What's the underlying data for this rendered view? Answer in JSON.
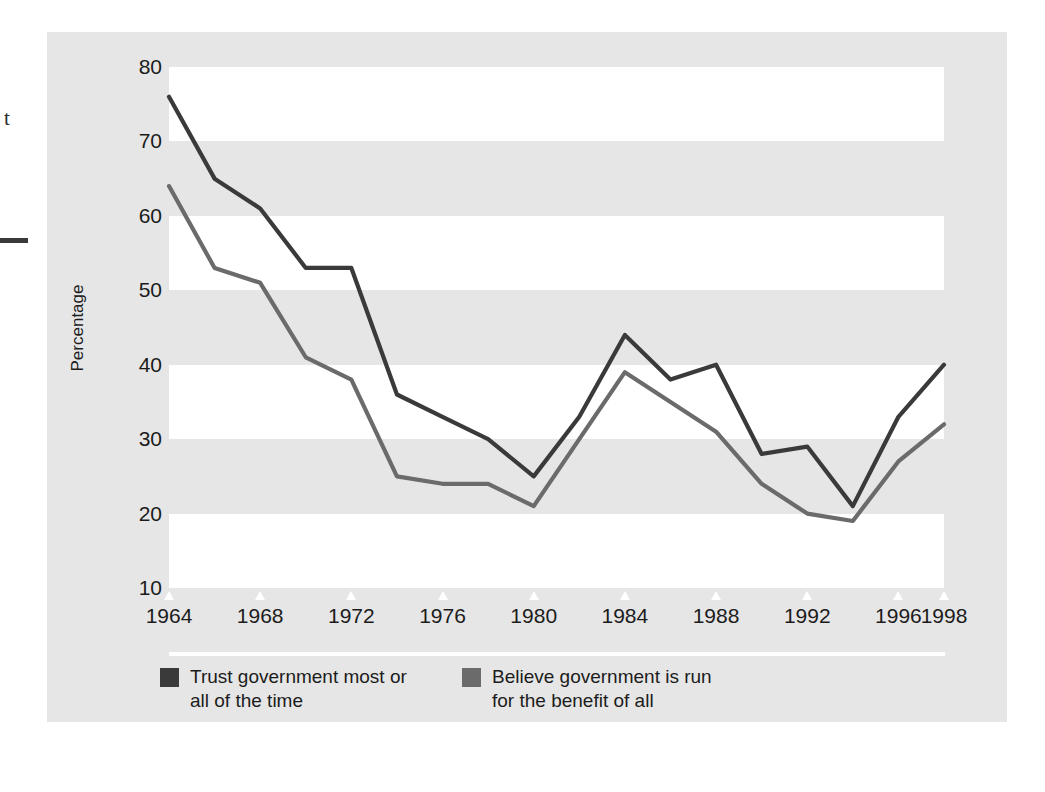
{
  "figure": {
    "margin_text": "t",
    "panel_color": "#e6e6e6",
    "band_color": "#ffffff"
  },
  "axes": {
    "ytitle": "Percentage",
    "yticks": [
      80,
      70,
      60,
      50,
      40,
      30,
      20,
      10
    ],
    "xticks": [
      1964,
      1968,
      1972,
      1976,
      1980,
      1984,
      1988,
      1992,
      1996,
      1998
    ]
  },
  "legend": {
    "items": [
      {
        "label": "Trust government most or\nall of the time",
        "color": "#3a3a3a",
        "swatch": "dark-square-swatch"
      },
      {
        "label": "Believe government is run\nfor the benefit of all",
        "color": "#6b6b6b",
        "swatch": "gray-square-swatch"
      }
    ]
  },
  "chart_data": {
    "type": "line",
    "title": "",
    "xlabel": "",
    "ylabel": "Percentage",
    "xlim": [
      1964,
      1998
    ],
    "ylim": [
      10,
      80
    ],
    "ytick_step": 10,
    "grid": "alternating-horizontal-bands",
    "legend_position": "bottom-left",
    "x": [
      1964,
      1966,
      1968,
      1970,
      1972,
      1974,
      1976,
      1978,
      1980,
      1982,
      1984,
      1986,
      1988,
      1990,
      1992,
      1994,
      1996,
      1998
    ],
    "series": [
      {
        "name": "Trust government most or all of the time",
        "color": "#3a3a3a",
        "values": [
          76,
          65,
          61,
          53,
          53,
          36,
          33,
          30,
          25,
          33,
          44,
          38,
          40,
          28,
          29,
          21,
          33,
          40
        ]
      },
      {
        "name": "Believe government is run for the benefit of all",
        "color": "#6b6b6b",
        "values": [
          64,
          53,
          51,
          41,
          38,
          25,
          24,
          24,
          21,
          30,
          39,
          35,
          31,
          24,
          20,
          19,
          27,
          32
        ]
      }
    ]
  }
}
